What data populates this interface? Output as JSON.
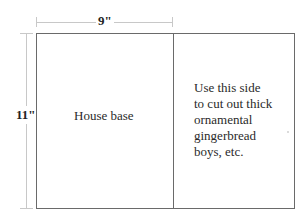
{
  "diagram": {
    "width_dimension": {
      "label": "9\""
    },
    "height_dimension": {
      "label": "11\""
    },
    "left_panel": {
      "label": "House base"
    },
    "right_panel": {
      "lines": [
        "Use this side",
        "to cut out thick",
        "ornamental",
        "gingerbread",
        "boys, etc."
      ]
    },
    "colors": {
      "outline": "#6a6a6a",
      "dimension_line": "#c8c8c8",
      "text": "#2a2a2a"
    }
  }
}
